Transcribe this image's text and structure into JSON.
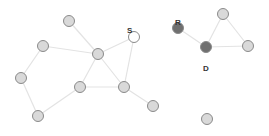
{
  "graph": {
    "colors": {
      "normal": "#d9d9d9",
      "source": "#ffffff",
      "dark": "#6f6f6f",
      "edge": "#e3e3e3",
      "stroke": "#8a8a8a"
    },
    "nodes": [
      {
        "id": "A",
        "x": 69,
        "y": 21,
        "type": "normal",
        "label": ""
      },
      {
        "id": "B",
        "x": 43,
        "y": 46,
        "type": "normal",
        "label": ""
      },
      {
        "id": "C",
        "x": 98,
        "y": 54,
        "type": "normal",
        "label": ""
      },
      {
        "id": "S",
        "x": 134,
        "y": 37,
        "type": "source",
        "label": "S",
        "lx": 127,
        "ly": 27
      },
      {
        "id": "E",
        "x": 21,
        "y": 78,
        "type": "normal",
        "label": ""
      },
      {
        "id": "F",
        "x": 80,
        "y": 87,
        "type": "normal",
        "label": ""
      },
      {
        "id": "G",
        "x": 124,
        "y": 87,
        "type": "normal",
        "label": ""
      },
      {
        "id": "H",
        "x": 38,
        "y": 116,
        "type": "normal",
        "label": ""
      },
      {
        "id": "I",
        "x": 153,
        "y": 106,
        "type": "normal",
        "label": ""
      },
      {
        "id": "R",
        "x": 178,
        "y": 28,
        "type": "dark",
        "label": "R",
        "lx": 175,
        "ly": 19
      },
      {
        "id": "D",
        "x": 206,
        "y": 47,
        "type": "dark",
        "label": "D",
        "lx": 203,
        "ly": 65
      },
      {
        "id": "J",
        "x": 223,
        "y": 14,
        "type": "normal",
        "label": ""
      },
      {
        "id": "K",
        "x": 248,
        "y": 46,
        "type": "normal",
        "label": ""
      },
      {
        "id": "L",
        "x": 207,
        "y": 119,
        "type": "normal",
        "label": ""
      }
    ],
    "edges": [
      [
        "A",
        "C"
      ],
      [
        "B",
        "C"
      ],
      [
        "B",
        "E"
      ],
      [
        "E",
        "H"
      ],
      [
        "H",
        "F"
      ],
      [
        "F",
        "C"
      ],
      [
        "F",
        "G"
      ],
      [
        "C",
        "G"
      ],
      [
        "C",
        "S"
      ],
      [
        "S",
        "G"
      ],
      [
        "G",
        "I"
      ],
      [
        "R",
        "D"
      ],
      [
        "D",
        "J"
      ],
      [
        "J",
        "K"
      ],
      [
        "D",
        "K"
      ]
    ]
  }
}
